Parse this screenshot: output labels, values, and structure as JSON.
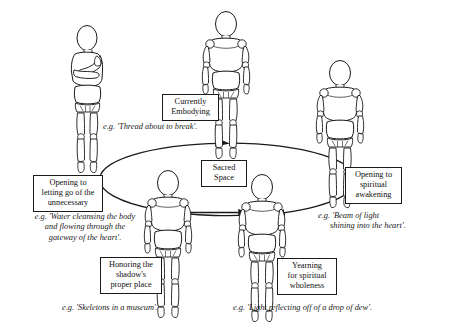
{
  "diagram": {
    "background_color": "#ffffff",
    "line_color": "#1a1a1a",
    "boxes": {
      "currently_embodying": {
        "line1": "Currently",
        "line2": "Embodying"
      },
      "sacred_space": {
        "line1": "Sacred",
        "line2": "Space"
      },
      "opening_letting_go": {
        "line1": "Opening to",
        "line2": "letting go of the",
        "line3": "unnecessary"
      },
      "opening_spiritual_awakening": {
        "line1": "Opening to",
        "line2": "spiritual",
        "line3": "awakening"
      },
      "honoring_shadow": {
        "line1": "Honoring the",
        "line2": "shadow's",
        "line3": "proper place"
      },
      "yearning_wholeness": {
        "line1": "Yearning",
        "line2": "for spiritual",
        "line3": "wholeness"
      }
    },
    "examples": {
      "thread": {
        "line1": "e.g. 'Thread about to break'."
      },
      "water": {
        "line1": "e.g. 'Water cleansing the body",
        "line2": "and flowing through the",
        "line3": "gateway of the heart'."
      },
      "beam": {
        "line1": "e.g. 'Beam of light",
        "line2": "shining into the heart'."
      },
      "skeletons": {
        "line1": "e.g. 'Skeletons in a museum'."
      },
      "dew": {
        "line1": "e.g. 'Light reflecting off of a drop of dew'."
      }
    },
    "figures": {
      "top_left": "mannequin-arms-crossed-profile",
      "top_center": "mannequin-standing-front",
      "top_right": "mannequin-standing-front",
      "bottom_left": "mannequin-standing-front",
      "bottom_right": "mannequin-standing-front"
    },
    "connectors": {
      "cycle_ellipse": "ellipse-clockwise-cycle",
      "horizontal_arrow": "arrow-right-between-bottom-figures"
    }
  }
}
